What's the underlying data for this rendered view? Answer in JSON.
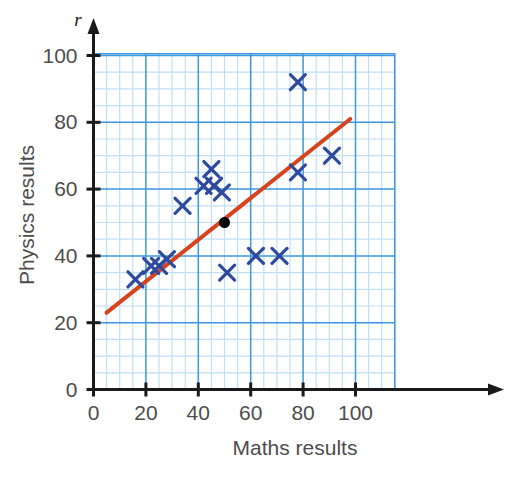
{
  "chart_data": {
    "type": "scatter",
    "title": "",
    "xlabel": "Maths results",
    "ylabel": "Physics results",
    "y_axis_variable": "r",
    "xlim": [
      0,
      115
    ],
    "ylim": [
      0,
      107
    ],
    "xticks": [
      0,
      20,
      40,
      60,
      80,
      100
    ],
    "yticks": [
      0,
      20,
      40,
      60,
      80,
      100
    ],
    "xtick_labels": [
      "0",
      "20",
      "40",
      "60",
      "80",
      "100"
    ],
    "ytick_labels": [
      "0",
      "20",
      "40",
      "60",
      "80",
      "100"
    ],
    "grid": true,
    "grid_major_step": 20,
    "grid_minor_step": 5,
    "grid_color_major": "#3c97e0",
    "grid_color_minor": "#bfe0f5",
    "legend": "none",
    "marker_style": "x",
    "marker_color": "#2d4a9e",
    "points": [
      {
        "x": 16,
        "y": 33
      },
      {
        "x": 22,
        "y": 37
      },
      {
        "x": 25,
        "y": 37
      },
      {
        "x": 28,
        "y": 39
      },
      {
        "x": 34,
        "y": 55
      },
      {
        "x": 42,
        "y": 61
      },
      {
        "x": 45,
        "y": 66
      },
      {
        "x": 46,
        "y": 61
      },
      {
        "x": 49,
        "y": 59
      },
      {
        "x": 51,
        "y": 35
      },
      {
        "x": 62,
        "y": 40
      },
      {
        "x": 71,
        "y": 40
      },
      {
        "x": 78,
        "y": 92
      },
      {
        "x": 78,
        "y": 65
      },
      {
        "x": 91,
        "y": 70
      }
    ],
    "mean_point": {
      "x": 50,
      "y": 50,
      "color": "#000000",
      "label": ""
    },
    "trend_line": {
      "color": "#d6431c",
      "x_start": 5,
      "y_start": 23,
      "x_end": 98,
      "y_end": 81,
      "description": "line of best fit"
    }
  },
  "axis": {
    "x_label": "Maths results",
    "y_label": "Physics results",
    "y_variable": "r",
    "origin_label": "0"
  }
}
